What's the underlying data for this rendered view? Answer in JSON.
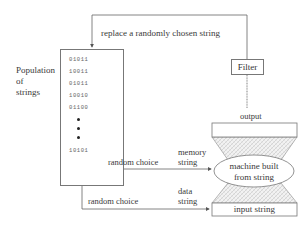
{
  "diagram": {
    "population": {
      "label_lines": [
        "Population",
        "of",
        "strings"
      ],
      "strings": [
        "01011",
        "10011",
        "01011",
        "10010",
        "01100"
      ],
      "ellipsis_dots": 3,
      "last_string": "10101"
    },
    "feedback_label": "replace a randomly chosen string",
    "filter_label": "Filter",
    "output_label": "output",
    "memory_path": {
      "choice_label": "random choice",
      "string_label_lines": [
        "memory",
        "string"
      ]
    },
    "data_path": {
      "choice_label": "random choice",
      "string_label_lines": [
        "data",
        "string"
      ]
    },
    "machine_label_lines": [
      "machine built",
      "from string"
    ],
    "input_label": "input string",
    "colors": {
      "line": "#666666",
      "box_border": "#777777",
      "hatch": "#cfcfcf",
      "text": "#333333"
    }
  }
}
